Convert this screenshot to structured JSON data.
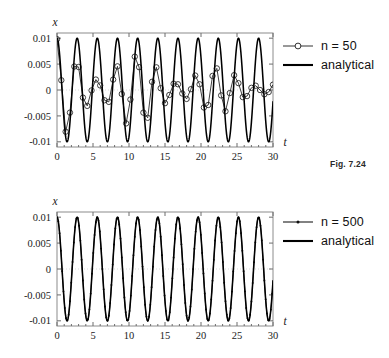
{
  "page": {
    "background": "#ffffff",
    "width": 389,
    "height": 358
  },
  "figures": [
    {
      "id": "figure-1",
      "caption": "Fig. 7.24",
      "legend": [
        {
          "label": "n = 50",
          "style": "line-with-open-circle-marker",
          "color": "#1c1c1c"
        },
        {
          "label": "analytical",
          "style": "solid-thick-line",
          "color": "#000000"
        }
      ]
    },
    {
      "id": "figure-2",
      "caption": "Fig. 7.25",
      "legend": [
        {
          "label": "n = 500",
          "style": "line-with-small-dot-marker",
          "color": "#1c1c1c"
        },
        {
          "label": "analytical",
          "style": "solid-thick-line",
          "color": "#000000"
        }
      ]
    }
  ],
  "chart_data": [
    {
      "type": "line",
      "title": "",
      "xlabel": "t",
      "ylabel": "x",
      "xlim": [
        0,
        30
      ],
      "ylim": [
        -0.011,
        0.011
      ],
      "xticks": [
        0,
        5,
        10,
        15,
        20,
        25,
        30
      ],
      "xticklabels": [
        "0",
        "5",
        "10",
        "15",
        "20",
        "25",
        "30"
      ],
      "yticks": [
        -0.01,
        -0.005,
        0,
        0.005,
        0.01
      ],
      "yticklabels": [
        "-0.01",
        "-0.005",
        "0",
        "0.005",
        "0.01"
      ],
      "grid": false,
      "legend_position": "right-outside",
      "omega": 2.2439,
      "amplitude": 0.01,
      "series": [
        {
          "name": "analytical",
          "kind": "analytical-cosine",
          "amplitude": 0.01,
          "omega": 2.2439,
          "phase": 0,
          "samples": 1400,
          "marker": "none",
          "linewidth": 1.55
        },
        {
          "name": "n = 50",
          "kind": "aliased-numeric",
          "amplitude": 0.01,
          "omega": 2.2439,
          "n_steps": 50,
          "dt": 0.6,
          "decay_start_amp": 0.0098,
          "decay_end_amp": 0.0028,
          "beat_omega": 0.56,
          "marker": "open-circle",
          "marker_size": 2.7,
          "linewidth": 0.85
        }
      ]
    },
    {
      "type": "line",
      "title": "",
      "xlabel": "t",
      "ylabel": "x",
      "xlim": [
        0,
        30
      ],
      "ylim": [
        -0.011,
        0.011
      ],
      "xticks": [
        0,
        5,
        10,
        15,
        20,
        25,
        30
      ],
      "xticklabels": [
        "0",
        "5",
        "10",
        "15",
        "20",
        "25",
        "30"
      ],
      "yticks": [
        -0.01,
        -0.005,
        0,
        0.005,
        0.01
      ],
      "yticklabels": [
        "-0.01",
        "-0.005",
        "0",
        "0.005",
        "0.01"
      ],
      "grid": false,
      "legend_position": "right-outside",
      "omega": 2.2439,
      "amplitude": 0.01,
      "series": [
        {
          "name": "analytical",
          "kind": "analytical-cosine",
          "amplitude": 0.01,
          "omega": 2.2439,
          "phase": 0,
          "samples": 1400,
          "marker": "none",
          "linewidth": 1.55
        },
        {
          "name": "n = 500",
          "kind": "converged-numeric",
          "amplitude": 0.01,
          "omega": 2.2439,
          "n_steps": 500,
          "dt": 0.06,
          "marker": "small-dot",
          "marker_size": 0.95,
          "marker_stride": 3,
          "linewidth": 0.85
        }
      ]
    }
  ],
  "plot_geometry": [
    {
      "left": 57,
      "top": 33,
      "right": 273,
      "bottom": 147
    },
    {
      "left": 57,
      "top": 32,
      "right": 273,
      "bottom": 146
    }
  ]
}
